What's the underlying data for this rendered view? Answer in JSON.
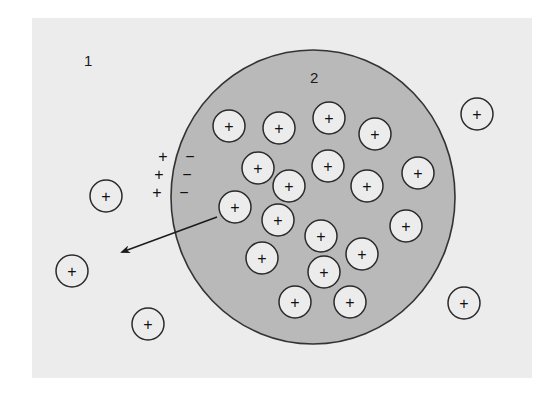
{
  "colors": {
    "page_bg": "#ffffff",
    "outside_bg": "#ececec",
    "cell_fill": "#b9b9b9",
    "cell_stroke": "#333333",
    "ion_fill": "#ececec",
    "ion_stroke": "#2a2a2a",
    "text": "#1a1a1a"
  },
  "panel": {
    "x": 32,
    "y": 18,
    "w": 500,
    "h": 360
  },
  "compartments": {
    "outside": {
      "label": "1",
      "x": 84,
      "y": 66
    },
    "inside": {
      "label": "2",
      "x": 310,
      "y": 83
    }
  },
  "cell": {
    "cx": 313,
    "cy": 197,
    "rx": 142,
    "ry": 147
  },
  "ion_radius": 16,
  "ion_symbol": "+",
  "ions_inside": [
    {
      "x": 229,
      "y": 126
    },
    {
      "x": 279,
      "y": 128
    },
    {
      "x": 329,
      "y": 118
    },
    {
      "x": 375,
      "y": 134
    },
    {
      "x": 258,
      "y": 168
    },
    {
      "x": 328,
      "y": 166
    },
    {
      "x": 289,
      "y": 186
    },
    {
      "x": 367,
      "y": 186
    },
    {
      "x": 418,
      "y": 173
    },
    {
      "x": 235,
      "y": 207
    },
    {
      "x": 278,
      "y": 220
    },
    {
      "x": 406,
      "y": 226
    },
    {
      "x": 321,
      "y": 236
    },
    {
      "x": 262,
      "y": 258
    },
    {
      "x": 362,
      "y": 254
    },
    {
      "x": 324,
      "y": 272
    },
    {
      "x": 295,
      "y": 302
    },
    {
      "x": 350,
      "y": 302
    }
  ],
  "ions_outside": [
    {
      "x": 477,
      "y": 114
    },
    {
      "x": 106,
      "y": 196
    },
    {
      "x": 72,
      "y": 271
    },
    {
      "x": 148,
      "y": 324
    },
    {
      "x": 464,
      "y": 303
    }
  ],
  "membrane_charges": {
    "outside_sign": "+",
    "inside_sign": "−",
    "rows": [
      {
        "plus_x": 163,
        "minus_x": 190,
        "y": 157
      },
      {
        "plus_x": 159,
        "minus_x": 187,
        "y": 175
      },
      {
        "plus_x": 157,
        "minus_x": 184,
        "y": 193
      }
    ]
  },
  "arrow": {
    "x1": 217,
    "y1": 217,
    "x2": 122,
    "y2": 252,
    "label": "ion efflux direction"
  }
}
